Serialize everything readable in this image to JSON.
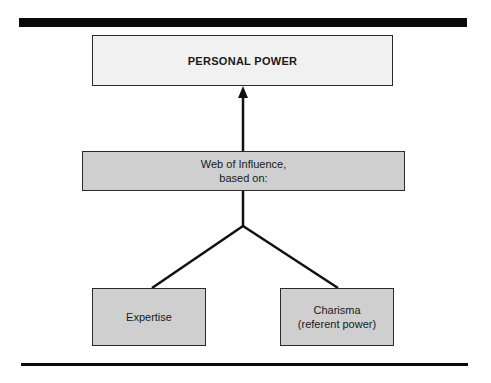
{
  "diagram": {
    "top_node": {
      "label": "PERSONAL POWER"
    },
    "middle_node": {
      "line1": "Web of Influence,",
      "line2": "based on:"
    },
    "leaf_nodes": [
      {
        "line1": "Expertise"
      },
      {
        "line1": "Charisma",
        "line2": "(referent power)"
      }
    ],
    "edges": [
      {
        "from": "Web of Influence",
        "to": "PERSONAL POWER",
        "style": "arrow"
      },
      {
        "from": "Expertise",
        "to": "Web of Influence",
        "style": "line"
      },
      {
        "from": "Charisma (referent power)",
        "to": "Web of Influence",
        "style": "line"
      }
    ],
    "colors": {
      "top_fill": "#f1f1f1",
      "node_fill": "#cfcfcf",
      "stroke": "#1a1a1a"
    }
  }
}
